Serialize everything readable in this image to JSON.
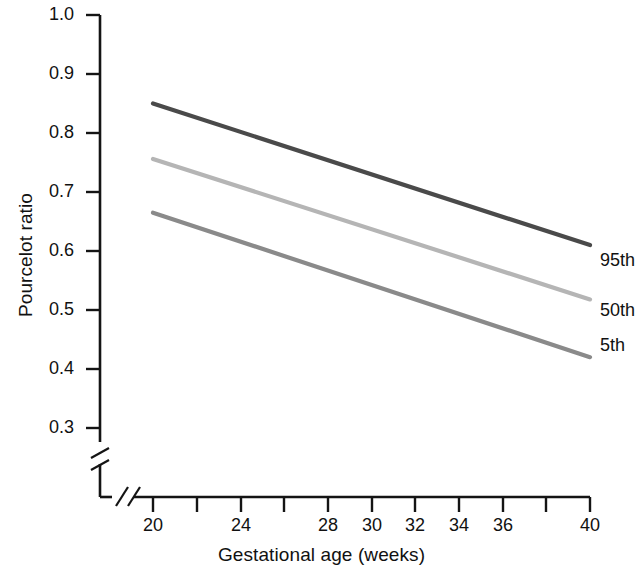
{
  "chart_data": {
    "type": "line",
    "title": "",
    "xlabel": "Gestational age (weeks)",
    "ylabel": "Pourcelot ratio",
    "x": [
      20,
      40
    ],
    "xlim": [
      20,
      40
    ],
    "ylim": [
      0.3,
      1.0
    ],
    "grid": false,
    "legend_position": "right-inline",
    "axis_breaks": {
      "y_axis_break": true,
      "x_axis_break": true
    },
    "x_ticks": [
      20,
      22,
      24,
      26,
      28,
      30,
      32,
      34,
      36,
      38,
      40
    ],
    "x_tick_labels": [
      "20",
      "",
      "24",
      "",
      "28",
      "30",
      "32",
      "34",
      "36",
      "",
      "40"
    ],
    "y_ticks": [
      0.3,
      0.4,
      0.5,
      0.6,
      0.7,
      0.8,
      0.9,
      1.0
    ],
    "y_tick_labels": [
      "0.3",
      "0.4",
      "0.5",
      "0.6",
      "0.7",
      "0.8",
      "0.9",
      "1.0"
    ],
    "series": [
      {
        "name": "95th",
        "label": "95th",
        "color": "#4a4a4a",
        "x": [
          20,
          40
        ],
        "values": [
          0.85,
          0.61
        ]
      },
      {
        "name": "50th",
        "label": "50th",
        "color": "#b5b5b5",
        "x": [
          20,
          40
        ],
        "values": [
          0.756,
          0.518
        ]
      },
      {
        "name": "5th",
        "label": "5th",
        "color": "#8a8a8a",
        "x": [
          20,
          40
        ],
        "values": [
          0.665,
          0.42
        ]
      }
    ]
  },
  "axes": {
    "y_title": "Pourcelot ratio",
    "x_title": "Gestational age (weeks)",
    "y_labels": {
      "t10": "1.0",
      "t09": "0.9",
      "t08": "0.8",
      "t07": "0.7",
      "t06": "0.6",
      "t05": "0.5",
      "t04": "0.4",
      "t03": "0.3"
    },
    "x_labels": {
      "t20": "20",
      "t24": "24",
      "t28": "28",
      "t30": "30",
      "t32": "32",
      "t34": "34",
      "t36": "36",
      "t40": "40"
    }
  },
  "legend": {
    "p95": "95th",
    "p50": "50th",
    "p5": "5th"
  },
  "colors": {
    "axis": "#141414",
    "p95": "#4a4a4a",
    "p50": "#b5b5b5",
    "p5": "#8a8a8a",
    "text": "#111111",
    "background": "#ffffff"
  }
}
